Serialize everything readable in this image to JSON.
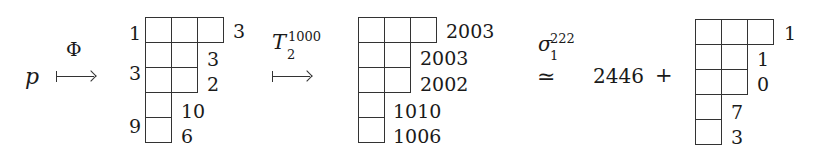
{
  "expression": {
    "start_symbol": "p",
    "map1": {
      "label": "Φ"
    },
    "tableau1": {
      "rows": [
        3,
        2,
        2,
        1,
        1
      ],
      "left_labels": [
        {
          "text": "1",
          "row": 0
        },
        {
          "text": "3",
          "row": 1.5
        },
        {
          "text": "9",
          "row": 3.5
        }
      ],
      "right_labels": [
        "3",
        "3",
        "2",
        "10",
        "6"
      ]
    },
    "map2": {
      "label_base": "T",
      "label_sub": "2",
      "label_sup": "1000"
    },
    "tableau2": {
      "rows": [
        3,
        2,
        2,
        1,
        1
      ],
      "right_labels": [
        "2003",
        "2003",
        "2002",
        "1010",
        "1006"
      ]
    },
    "relation": {
      "symbol": "≃",
      "label_base": "σ",
      "label_sub": "1",
      "label_sup": "222"
    },
    "constant": "2446",
    "plus": "+",
    "tableau3": {
      "rows": [
        3,
        2,
        2,
        1,
        1
      ],
      "right_labels": [
        "1",
        "1",
        "0",
        "7",
        "3"
      ]
    }
  }
}
